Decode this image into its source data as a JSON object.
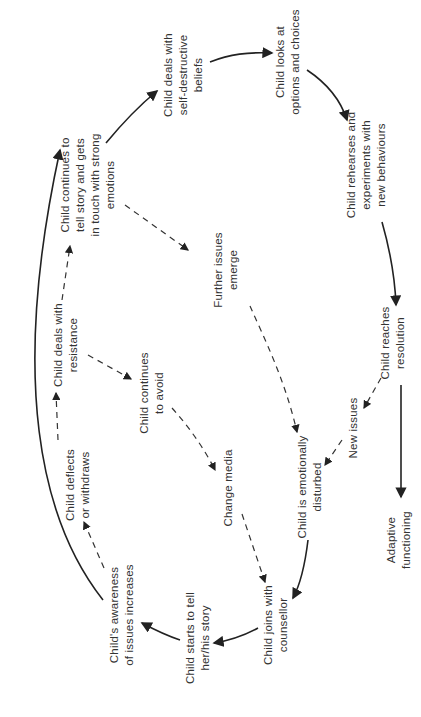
{
  "diagram": {
    "orientation": "rotated-90-ccw",
    "nodes": [
      {
        "id": "child-joins",
        "lines": [
          "Child joins with",
          "counsellor"
        ]
      },
      {
        "id": "starts-story",
        "lines": [
          "Child starts to tell",
          "her/his story"
        ]
      },
      {
        "id": "awareness",
        "lines": [
          "Child's awareness",
          "of issues increases"
        ]
      },
      {
        "id": "deflects",
        "lines": [
          "Child deflects",
          "or withdraws"
        ]
      },
      {
        "id": "resistance",
        "lines": [
          "Child deals with",
          "resistance"
        ]
      },
      {
        "id": "continues-avoid",
        "lines": [
          "Child continues",
          "to avoid"
        ]
      },
      {
        "id": "change-media",
        "lines": [
          "Change media"
        ]
      },
      {
        "id": "strong-emotions",
        "lines": [
          "Child continues to",
          "tell story and gets",
          "in touch with strong",
          "emotions"
        ]
      },
      {
        "id": "further-issues",
        "lines": [
          "Further issues",
          "emerge"
        ]
      },
      {
        "id": "self-destructive",
        "lines": [
          "Child deals with",
          "self-destructive",
          "beliefs"
        ]
      },
      {
        "id": "options",
        "lines": [
          "Child looks at",
          "options and choices"
        ]
      },
      {
        "id": "rehearses",
        "lines": [
          "Child rehearses and",
          "experiments with",
          "new behaviours"
        ]
      },
      {
        "id": "resolution",
        "lines": [
          "Child reaches",
          "resolution"
        ]
      },
      {
        "id": "new-issues",
        "lines": [
          "New issues"
        ]
      },
      {
        "id": "emotionally-disturbed",
        "lines": [
          "Child is emotionally",
          "disturbed"
        ]
      },
      {
        "id": "adaptive",
        "lines": [
          "Adaptive",
          "functioning"
        ]
      }
    ],
    "edges": [
      {
        "from": "child-joins",
        "to": "starts-story",
        "style": "solid"
      },
      {
        "from": "starts-story",
        "to": "awareness",
        "style": "solid"
      },
      {
        "from": "awareness",
        "to": "strong-emotions",
        "style": "solid"
      },
      {
        "from": "awareness",
        "to": "deflects",
        "style": "dashed"
      },
      {
        "from": "deflects",
        "to": "resistance",
        "style": "dashed"
      },
      {
        "from": "resistance",
        "to": "strong-emotions",
        "style": "dashed"
      },
      {
        "from": "resistance",
        "to": "continues-avoid",
        "style": "dashed"
      },
      {
        "from": "continues-avoid",
        "to": "change-media",
        "style": "dashed"
      },
      {
        "from": "change-media",
        "to": "child-joins",
        "style": "dashed"
      },
      {
        "from": "strong-emotions",
        "to": "self-destructive",
        "style": "solid"
      },
      {
        "from": "strong-emotions",
        "to": "further-issues",
        "style": "dashed"
      },
      {
        "from": "further-issues",
        "to": "emotionally-disturbed",
        "style": "dashed"
      },
      {
        "from": "self-destructive",
        "to": "options",
        "style": "solid"
      },
      {
        "from": "options",
        "to": "rehearses",
        "style": "solid"
      },
      {
        "from": "rehearses",
        "to": "resolution",
        "style": "solid"
      },
      {
        "from": "resolution",
        "to": "new-issues",
        "style": "dashed"
      },
      {
        "from": "new-issues",
        "to": "emotionally-disturbed",
        "style": "dashed"
      },
      {
        "from": "resolution",
        "to": "adaptive",
        "style": "solid"
      },
      {
        "from": "emotionally-disturbed",
        "to": "child-joins",
        "style": "solid"
      }
    ]
  }
}
